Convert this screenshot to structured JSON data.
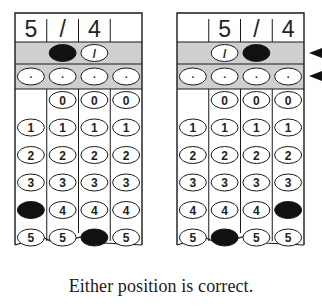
{
  "grids": [
    {
      "name": "left-grid",
      "header": [
        "5",
        "/",
        "4",
        ""
      ],
      "filled": {
        "slash": [
          1
        ],
        "decimal": [],
        "digits": {
          "0": 4,
          "2": 5
        }
      },
      "description": "5/4 entered starting in column 1"
    },
    {
      "name": "right-grid",
      "header": [
        "",
        "5",
        "/",
        "4"
      ],
      "filled": {
        "slash": [
          2
        ],
        "decimal": [],
        "digits": {
          "1": 5,
          "3": 4
        }
      },
      "description": "5/4 entered starting in column 2"
    }
  ],
  "rows": {
    "slash_symbol": "/",
    "decimal_symbol": ".",
    "digit_rows": [
      "0",
      "1",
      "2",
      "3",
      "4",
      "5"
    ]
  },
  "arrows": [
    "fraction-bar-row-pointer",
    "decimal-point-row-pointer"
  ],
  "caption": "Either position is correct.",
  "colors": {
    "shaded_row": "#cfcfcf",
    "ink": "#1a1a1a",
    "filled_bubble": "#111111",
    "background": "#ffffff"
  }
}
